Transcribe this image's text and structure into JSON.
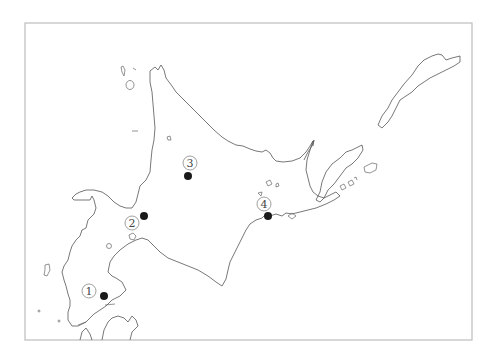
{
  "map": {
    "region": "Hokkaido",
    "colors": {
      "marker": "#1a1a1a",
      "coastline": "#555555",
      "frame": "#bdbdbd"
    },
    "markers": [
      {
        "id": "1",
        "label": "①"
      },
      {
        "id": "2",
        "label": "②"
      },
      {
        "id": "3",
        "label": "③"
      },
      {
        "id": "4",
        "label": "④"
      }
    ]
  }
}
